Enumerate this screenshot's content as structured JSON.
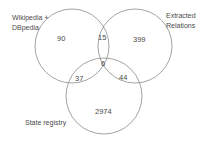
{
  "diagram": {
    "type": "venn",
    "sets": [
      {
        "name": "Wikipedia + DBpedia",
        "label_lines": [
          "Wikipedia +",
          "DBpedia"
        ],
        "cx": 72,
        "cy": 46,
        "r": 37
      },
      {
        "name": "Extracted Relations",
        "label_lines": [
          "Extracted",
          "Relations"
        ],
        "cx": 135,
        "cy": 46,
        "r": 37
      },
      {
        "name": "State registry",
        "label_lines": [
          "State registry"
        ],
        "cx": 104,
        "cy": 96,
        "r": 38
      }
    ],
    "regions": {
      "wiki_only": "90",
      "extracted_only": "399",
      "state_only": "2974",
      "wiki_extracted": "15",
      "wiki_state": "37",
      "extracted_state": "44",
      "all_three": "6"
    },
    "stroke_color": "#8c8c8c",
    "text_color": "#4a4a4a"
  }
}
